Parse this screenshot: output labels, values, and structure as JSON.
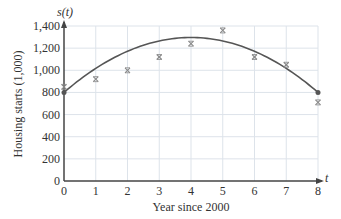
{
  "chart_data": {
    "type": "scatter",
    "title": "",
    "xlabel": "Year since 2000",
    "ylabel": "Housing starts (1,000)",
    "x_axis_var": "t",
    "y_axis_var": "s(t)",
    "xlim": [
      0,
      8
    ],
    "ylim": [
      0,
      1400
    ],
    "x_ticks": [
      "0",
      "1",
      "2",
      "3",
      "4",
      "5",
      "6",
      "7",
      "8"
    ],
    "y_ticks": [
      "0",
      "200",
      "400",
      "600",
      "800",
      "1,000",
      "1,200",
      "1,400"
    ],
    "grid": true,
    "legend": "none",
    "series": [
      {
        "name": "Data",
        "type": "scatter",
        "marker": "x",
        "x": [
          0,
          1,
          2,
          3,
          4,
          5,
          6,
          7,
          8
        ],
        "values": [
          850,
          920,
          1000,
          1120,
          1240,
          1360,
          1120,
          1050,
          710
        ]
      },
      {
        "name": "Quadratic model s(t)",
        "type": "line",
        "x": [
          0,
          1,
          2,
          3,
          4,
          5,
          6,
          7,
          8
        ],
        "values": [
          800,
          1017,
          1172,
          1265,
          1296,
          1265,
          1172,
          1017,
          800
        ],
        "endpoints_marked": true
      }
    ],
    "colors": {
      "axis": "#444444",
      "grid": "#dde3ea",
      "curve": "#555555",
      "marker": "#888888"
    }
  }
}
